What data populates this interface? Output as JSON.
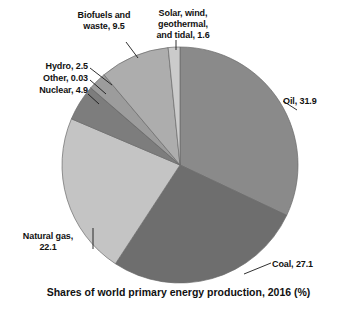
{
  "chart_data": {
    "type": "pie",
    "title": "Shares of world primary energy production, 2016 (%)",
    "caption": "Shares of world primary energy production, 2016 (%)",
    "unit": "%",
    "year": "2016",
    "legend": "none",
    "grid": false,
    "start_angle_deg": 0,
    "direction": "clockwise",
    "categories": [
      "Oil",
      "Coal",
      "Natural gas",
      "Nuclear",
      "Other",
      "Hydro",
      "Biofuels and waste",
      "Solar, wind, geothermal, and tidal"
    ],
    "values": [
      31.9,
      27.1,
      22.1,
      4.9,
      0.03,
      2.5,
      9.5,
      1.6
    ],
    "colors": [
      "#8a8a8a",
      "#6e6e6e",
      "#c4c4c4",
      "#7d7d7d",
      "#8f8f8f",
      "#9c9c9c",
      "#adadad",
      "#cbcbcb"
    ],
    "slices": [
      {
        "name": "Oil",
        "value": 31.9,
        "label": "Oil, 31.9",
        "color": "#8a8a8a"
      },
      {
        "name": "Coal",
        "value": 27.1,
        "label": "Coal, 27.1",
        "color": "#6e6e6e"
      },
      {
        "name": "Natural gas",
        "value": 22.1,
        "label": "Natural gas,\n22.1",
        "color": "#c4c4c4"
      },
      {
        "name": "Nuclear",
        "value": 4.9,
        "label": "Nuclear, 4.9",
        "color": "#7d7d7d"
      },
      {
        "name": "Other",
        "value": 0.03,
        "label": "Other, 0.03",
        "color": "#8f8f8f"
      },
      {
        "name": "Hydro",
        "value": 2.5,
        "label": "Hydro, 2.5",
        "color": "#9c9c9c"
      },
      {
        "name": "Biofuels and waste",
        "value": 9.5,
        "label": "Biofuels and\nwaste, 9.5",
        "color": "#adadad"
      },
      {
        "name": "Solar, wind, geothermal, and tidal",
        "value": 1.6,
        "label": "Solar, wind,\ngeothermal,\nand tidal, 1.6",
        "color": "#cbcbcb"
      }
    ]
  },
  "labels": {
    "oil": "Oil, 31.9",
    "coal": "Coal, 27.1",
    "natural_gas": "Natural gas,\n22.1",
    "nuclear": "Nuclear, 4.9",
    "other": "Other, 0.03",
    "hydro": "Hydro, 2.5",
    "biofuels": "Biofuels and\nwaste, 9.5",
    "solar": "Solar, wind,\ngeothermal,\nand tidal, 1.6"
  },
  "caption": "Shares of world primary energy production, 2016 (%)"
}
